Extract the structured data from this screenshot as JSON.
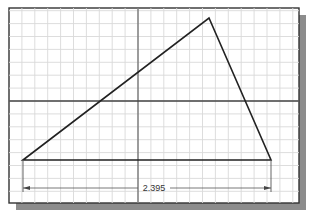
{
  "drawing": {
    "frame": {
      "x": 9,
      "y": 8,
      "width": 290,
      "height": 195
    },
    "shadow_color": "#8c8c8c",
    "grid": {
      "spacing": 12.9,
      "color": "#d6d6d6"
    },
    "axes": {
      "vertical_x": 138,
      "horizontal_y": 101,
      "color": "#555555"
    },
    "triangle": {
      "vertices": [
        [
          23,
          160
        ],
        [
          209,
          18
        ],
        [
          271,
          160
        ]
      ],
      "stroke": "#222222"
    },
    "dimension": {
      "value": "2.395",
      "y": 188,
      "x_start": 23,
      "x_end": 271
    }
  }
}
